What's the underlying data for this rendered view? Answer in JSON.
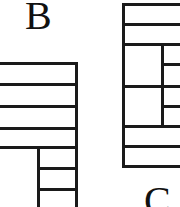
{
  "diagram": {
    "labels": {
      "b": "B",
      "c": "C"
    },
    "colors": {
      "line": "#1a1a1a",
      "background": "#ffffff",
      "label_text": "#111111"
    }
  }
}
